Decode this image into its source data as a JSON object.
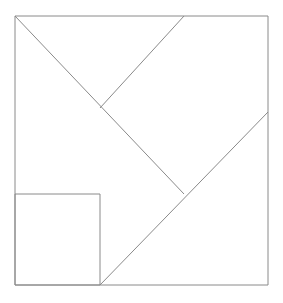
{
  "figure": {
    "canvas": {
      "width": 283,
      "height": 303
    },
    "background_color": "#ffffff",
    "stroke_color": "#8a8a8a",
    "stroke_width": 1
  },
  "chart_data": {
    "type": "diagram",
    "xlabel": "",
    "ylabel": "",
    "xlim": [
      0,
      283
    ],
    "ylim": [
      0,
      303
    ],
    "grid": false,
    "legend": null,
    "shapes": [
      {
        "name": "outer-square",
        "kind": "rect",
        "x": 15,
        "y": 16,
        "width": 253,
        "height": 269,
        "points": [
          [
            15,
            16
          ],
          [
            268,
            16
          ],
          [
            268,
            285
          ],
          [
            15,
            285
          ]
        ],
        "closed": true
      },
      {
        "name": "small-square",
        "kind": "rect",
        "x": 15,
        "y": 194,
        "width": 85,
        "height": 91,
        "points": [
          [
            15,
            194
          ],
          [
            100,
            194
          ],
          [
            100,
            285
          ],
          [
            15,
            285
          ]
        ],
        "closed": true
      },
      {
        "name": "main-diagonal",
        "kind": "line",
        "points": [
          [
            15,
            16
          ],
          [
            184,
            194
          ]
        ],
        "closed": false
      },
      {
        "name": "upper-right-diagonal",
        "kind": "line",
        "points": [
          [
            100,
            108
          ],
          [
            184,
            16
          ]
        ],
        "closed": false
      },
      {
        "name": "long-diagonal",
        "kind": "line",
        "points": [
          [
            100,
            285
          ],
          [
            268,
            112
          ]
        ],
        "closed": false
      }
    ],
    "vertices": [
      {
        "name": "outer-top-left",
        "x": 15,
        "y": 16
      },
      {
        "name": "outer-top-right",
        "x": 268,
        "y": 16
      },
      {
        "name": "outer-bottom-right",
        "x": 268,
        "y": 285
      },
      {
        "name": "outer-bottom-left",
        "x": 15,
        "y": 285
      },
      {
        "name": "v-junction",
        "x": 100,
        "y": 108
      },
      {
        "name": "top-edge-meeting",
        "x": 184,
        "y": 16
      },
      {
        "name": "center-junction",
        "x": 184,
        "y": 194
      },
      {
        "name": "right-edge-meeting",
        "x": 268,
        "y": 112
      },
      {
        "name": "bottom-edge-meeting",
        "x": 100,
        "y": 285
      },
      {
        "name": "small-square-top-left",
        "x": 15,
        "y": 194
      },
      {
        "name": "small-square-top-right",
        "x": 100,
        "y": 194
      }
    ]
  }
}
